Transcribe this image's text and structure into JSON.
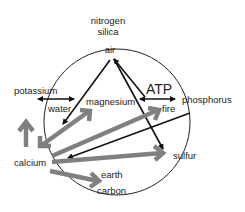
{
  "labels": {
    "nitrogen": "nitrogen",
    "silica": "silica",
    "air": "air",
    "potassium": "potassium",
    "water": "water",
    "magnesium": "magnesium",
    "atp": "ATP",
    "fire": "fire",
    "phosphorus": "phosphorus",
    "calcium": "calcium",
    "sulfur": "sulfur",
    "earth": "earth",
    "carbon": "carbon"
  },
  "colors": {
    "black_arrow": "#111111",
    "gray_arrow": "#808080",
    "circle": "#222222",
    "text": "#222222"
  }
}
